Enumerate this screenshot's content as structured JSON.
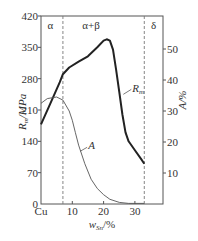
{
  "chart_data": {
    "type": "line",
    "title": "",
    "xlabel": "w_Sn/%",
    "ylabel": "R_m/MPa",
    "y2label": "A/%",
    "xlim": [
      0,
      40
    ],
    "ylim": [
      0,
      420
    ],
    "y2lim": [
      0,
      65
    ],
    "x_ticks": [
      {
        "v": 0,
        "label": "Cu"
      },
      {
        "v": 10,
        "label": "10"
      },
      {
        "v": 20,
        "label": "20"
      },
      {
        "v": 30,
        "label": "30"
      }
    ],
    "y_ticks": [
      0,
      70,
      140,
      210,
      280,
      350,
      420
    ],
    "y2_ticks": [
      10,
      20,
      30,
      40,
      50
    ],
    "phase_boundaries": [
      7,
      33
    ],
    "phase_labels": [
      {
        "label": "α",
        "x": 3
      },
      {
        "label": "α+β",
        "x": 16
      },
      {
        "label": "δ",
        "x": 36
      }
    ],
    "series": [
      {
        "name": "R_m",
        "axis": "left",
        "style": "solid-thick",
        "x": [
          0,
          3,
          6,
          7,
          9,
          12,
          15,
          18,
          20,
          21,
          22,
          23,
          24,
          25,
          26,
          27,
          28,
          30,
          32,
          33
        ],
        "values": [
          178,
          225,
          272,
          290,
          305,
          318,
          330,
          350,
          365,
          368,
          365,
          345,
          300,
          250,
          200,
          160,
          140,
          120,
          100,
          90
        ]
      },
      {
        "name": "A",
        "axis": "right",
        "style": "solid-thin",
        "x": [
          0,
          2,
          5,
          7,
          9,
          10,
          11,
          12,
          14,
          16,
          18,
          20,
          22,
          25,
          28,
          33
        ],
        "values": [
          32.5,
          34,
          34.5,
          33.5,
          30,
          27,
          23,
          19,
          13,
          8,
          5,
          3,
          1.5,
          0.5,
          0.2,
          0.2
        ]
      }
    ],
    "annotations": [
      {
        "text": "R_m",
        "series": "R_m",
        "at_x": 26
      },
      {
        "text": "A",
        "series": "A",
        "at_x": 12
      }
    ],
    "grid": false,
    "legend": "inline-labels"
  }
}
